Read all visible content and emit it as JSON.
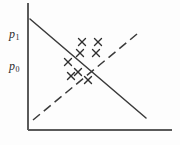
{
  "figure": {
    "name": "supply-demand-scatter-diagram",
    "background_color": "#fdfdfd",
    "ink_color": "#3a3a3a",
    "width": 180,
    "height": 145
  },
  "axes": {
    "origin": {
      "x": 28,
      "y": 130
    },
    "y_axis": {
      "x": 28,
      "y_top": 3,
      "y_bottom": 130
    },
    "x_axis": {
      "y": 130,
      "x_left": 28,
      "x_right": 172
    },
    "y_tick_labels": [
      {
        "id": "p1",
        "base": "p",
        "subscript": "1",
        "y": 33
      },
      {
        "id": "p0",
        "base": "p",
        "subscript": "0",
        "y": 65
      }
    ],
    "x_tick_labels": []
  },
  "chart_data": {
    "type": "scatter",
    "title": "",
    "xlabel": "",
    "ylabel": "",
    "xlim": [
      28,
      172
    ],
    "ylim": [
      130,
      3
    ],
    "grid": false,
    "legend": "none",
    "series": [
      {
        "name": "observations",
        "marker": "x",
        "marker_color": "#2f2f2f",
        "marker_size": 7,
        "points": [
          {
            "x": 82,
            "y": 42
          },
          {
            "x": 98,
            "y": 42
          },
          {
            "x": 80,
            "y": 53
          },
          {
            "x": 96,
            "y": 53
          },
          {
            "x": 68,
            "y": 62
          },
          {
            "x": 78,
            "y": 72
          },
          {
            "x": 71,
            "y": 76
          },
          {
            "x": 88,
            "y": 80
          }
        ]
      }
    ],
    "lines": [
      {
        "name": "demand-curve",
        "style": "solid",
        "color": "#3a3a3a",
        "width": 1.4,
        "slope": "negative",
        "x1": 30,
        "y1": 19,
        "x2": 146,
        "y2": 118
      },
      {
        "name": "supply-curve",
        "style": "dashed",
        "color": "#3a3a3a",
        "width": 1.4,
        "dash_pattern": "9 5",
        "slope": "positive",
        "x1": 33,
        "y1": 120,
        "x2": 137,
        "y2": 34
      }
    ]
  }
}
